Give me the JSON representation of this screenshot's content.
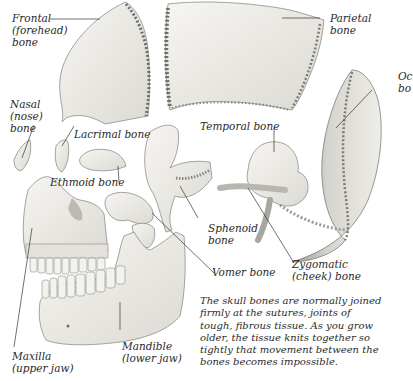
{
  "diagram": {
    "colors": {
      "background": "#ffffff",
      "bone_fill": "#f1f0ec",
      "bone_shade": "#c9c7c1",
      "suture_dark": "#6f6d68",
      "leader_line": "#333333",
      "text": "#2a2a2a"
    },
    "labels": {
      "frontal": "Frontal\n(forehead)\nbone",
      "parietal": "Parietal\nbone",
      "occipital": "Oc\nbo",
      "nasal": "Nasal\n(nose)\nbone",
      "lacrimal": "Lacrimal bone",
      "ethmoid": "Ethmoid bone",
      "temporal": "Temporal bone",
      "sphenoid": "Sphenoid\nbone",
      "zygomatic": "Zygomatic\n(cheek) bone",
      "vomer": "Vomer bone",
      "mandible": "Mandible\n(lower jaw)",
      "maxilla": "Maxilla\n(upper jaw)"
    },
    "caption_lines": [
      "The skull bones are normally joined",
      "firmly at the sutures, joints of",
      "tough, fibrous tissue. As you grow",
      "older, the tissue knits together so",
      "tightly that movement between the",
      "bones becomes impossible."
    ]
  }
}
